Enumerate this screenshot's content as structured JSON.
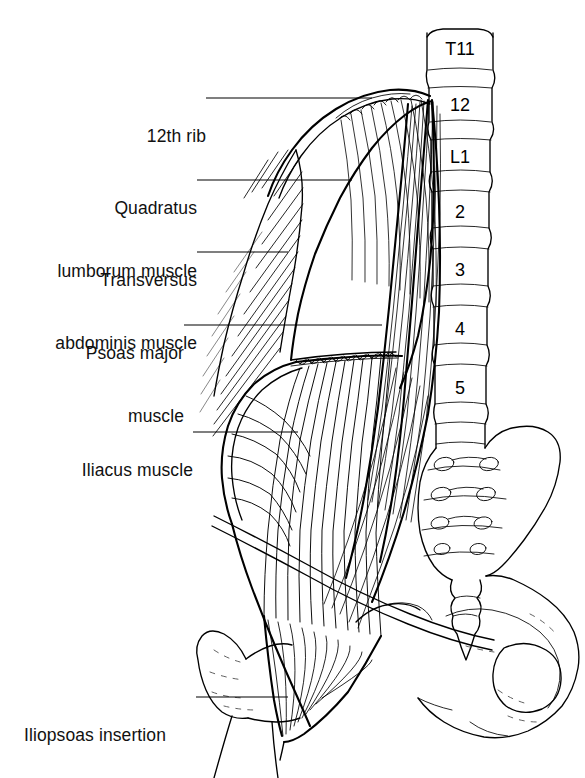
{
  "figure": {
    "background_color": "#ffffff",
    "ink_color": "#000000",
    "style": "black-and-white anatomical line drawing"
  },
  "labels": [
    {
      "id": "rib12",
      "text": "12th rib",
      "lines": [
        "12th rib"
      ]
    },
    {
      "id": "quadratus",
      "text": "Quadratus lumborum muscle",
      "lines": [
        "Quadratus",
        "lumborum muscle"
      ]
    },
    {
      "id": "transversus",
      "text": "Transversus abdominis muscle",
      "lines": [
        "Transversus",
        "abdominis muscle"
      ]
    },
    {
      "id": "psoas",
      "text": "Psoas major muscle",
      "lines": [
        "Psoas major",
        "muscle"
      ]
    },
    {
      "id": "iliacus",
      "text": "Iliacus muscle",
      "lines": [
        "Iliacus muscle"
      ]
    },
    {
      "id": "iliopsoas",
      "text": "Iliopsoas insertion",
      "lines": [
        "Iliopsoas insertion"
      ]
    }
  ],
  "label_text": {
    "rib12_l1": "12th rib",
    "quadratus_l1": "Quadratus",
    "quadratus_l2": "lumborum muscle",
    "transversus_l1": "Transversus",
    "transversus_l2": "abdominis muscle",
    "psoas_l1": "Psoas major",
    "psoas_l2": "muscle",
    "iliacus_l1": "Iliacus muscle",
    "iliopsoas_l1": "Iliopsoas insertion"
  },
  "vertebrae": [
    {
      "id": "t11",
      "label": "T11"
    },
    {
      "id": "t12",
      "label": "12"
    },
    {
      "id": "l1",
      "label": "L1"
    },
    {
      "id": "l2",
      "label": "2"
    },
    {
      "id": "l3",
      "label": "3"
    },
    {
      "id": "l4",
      "label": "4"
    },
    {
      "id": "l5",
      "label": "5"
    }
  ],
  "vertebra_labels": {
    "t11": "T11",
    "t12": "12",
    "l1": "L1",
    "l2": "2",
    "l3": "3",
    "l4": "4",
    "l5": "5"
  },
  "structures": [
    "twelfth-rib",
    "quadratus-lumborum-muscle",
    "transversus-abdominis-aponeurosis",
    "psoas-major-muscle",
    "iliacus-muscle",
    "iliopsoas-tendon-insertion",
    "lumbar-vertebral-column",
    "sacrum",
    "sacral-foramina",
    "coccyx",
    "ilium",
    "obturator-foramen",
    "femur-greater-trochanter",
    "inguinal-ligament"
  ],
  "sacral_foramina_pairs": 4
}
